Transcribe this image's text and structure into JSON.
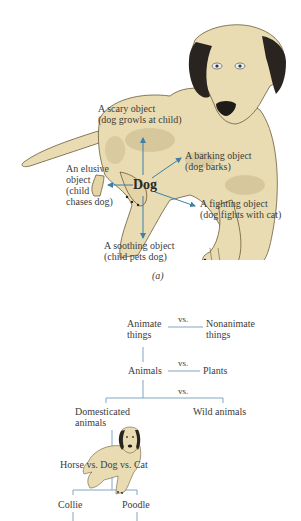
{
  "figure_a": {
    "center_label": "Dog",
    "caption": "(a)",
    "arrow_color": "#3f7fa8",
    "dog_fur_color": "#e9dcb2",
    "dog_patch_color": "#d2c297",
    "labels": {
      "scary": [
        "A scary object",
        "(dog growls at child)"
      ],
      "barking": [
        "A barking object",
        "(dog barks)"
      ],
      "elusive": [
        "An elusive",
        "object",
        "(child",
        "chases dog)"
      ],
      "fighting": [
        "A fighting object",
        "(dog fights with cat)"
      ],
      "soothing": [
        "A soothing object",
        "(child pets dog)"
      ]
    }
  },
  "figure_b": {
    "line_color": "#7fa6c2",
    "level1": {
      "left": [
        "Animate",
        "things"
      ],
      "vs": "vs.",
      "right": [
        "Nonanimate",
        "things"
      ]
    },
    "level2": {
      "left": "Animals",
      "vs": "vs.",
      "right": "Plants"
    },
    "level3": {
      "vs": "vs.",
      "left": [
        "Domesticated",
        "animals"
      ],
      "right": "Wild animals"
    },
    "level4": {
      "text": "Horse vs. Dog vs. Cat"
    },
    "level5": {
      "left": "Collie",
      "right": "Poodle"
    }
  }
}
